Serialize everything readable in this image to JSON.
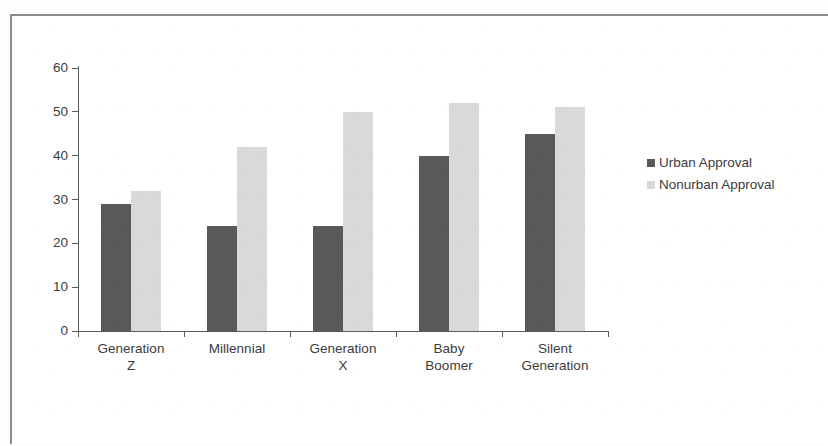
{
  "chart_data": {
    "type": "bar",
    "title": "",
    "xlabel": "",
    "ylabel": "",
    "ylim": [
      0,
      60
    ],
    "yticks": [
      0,
      10,
      20,
      30,
      40,
      50,
      60
    ],
    "ytick_labels": [
      "0",
      "10",
      "20",
      "30",
      "40",
      "50",
      "60"
    ],
    "grid": false,
    "legend_position": "right",
    "categories": [
      "Generation Z",
      "Millennial",
      "Generation X",
      "Baby Boomer",
      "Silent Generation"
    ],
    "category_label_lines": [
      [
        "Generation",
        "Z"
      ],
      [
        "Millennial",
        ""
      ],
      [
        "Generation",
        "X"
      ],
      [
        "Baby",
        "Boomer"
      ],
      [
        "Silent",
        "Generation"
      ]
    ],
    "series": [
      {
        "name": "Urban Approval",
        "color": "#595959",
        "values": [
          29,
          24,
          24,
          40,
          45
        ]
      },
      {
        "name": "Nonurban Approval",
        "color": "#d9d9d9",
        "values": [
          32,
          42,
          50,
          52,
          51
        ]
      }
    ]
  },
  "legend": {
    "items": [
      {
        "label": "Urban Approval",
        "swatch": "urban-swatch"
      },
      {
        "label": "Nonurban Approval",
        "swatch": "nonurban-swatch"
      }
    ]
  }
}
